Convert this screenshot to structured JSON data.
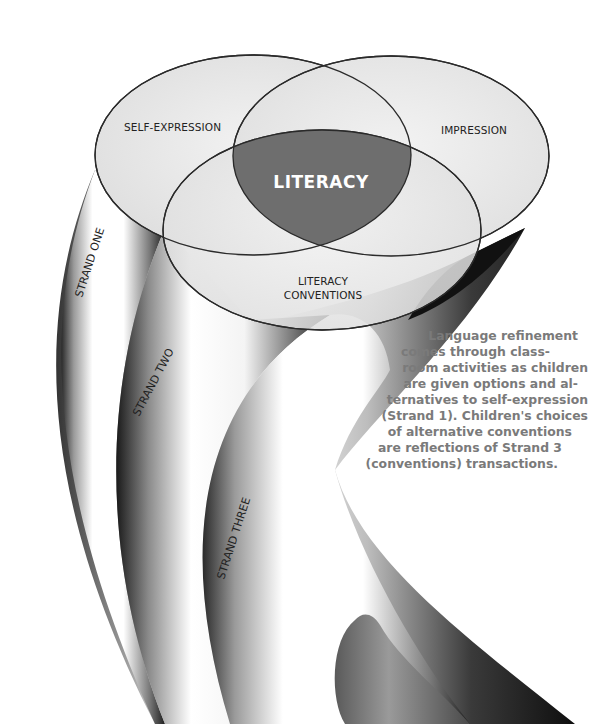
{
  "diagram": {
    "venn": {
      "center_label": "LITERACY",
      "circles": [
        {
          "label": "SELF-EXPRESSION"
        },
        {
          "label": "IMPRESSION"
        },
        {
          "label_line1": "LITERACY",
          "label_line2": "CONVENTIONS"
        }
      ]
    },
    "strands": [
      {
        "label": "STRAND ONE"
      },
      {
        "label": "STRAND TWO"
      },
      {
        "label": "STRAND THREE"
      }
    ],
    "caption": {
      "lines": [
        "Language refinement",
        "comes through class-",
        "room activities as children",
        "are given options and al-",
        "ternatives to self-expression",
        "(Strand 1). Children's choices",
        "of alternative conventions",
        "are reflections of Strand 3",
        "(conventions) transactions."
      ]
    },
    "colors": {
      "center_fill": "#6e6e6e",
      "venn_fill": "#e6e6e6",
      "outline": "#2a2a2a",
      "caption_text": "#7a7a7a"
    }
  }
}
